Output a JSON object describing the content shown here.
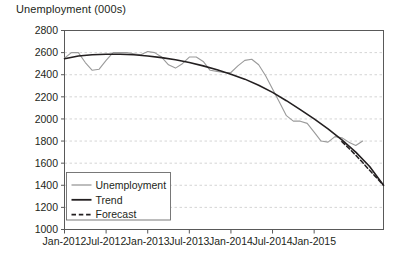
{
  "chart_data": {
    "type": "line",
    "title": "Unemployment (000s)",
    "xlabel": "",
    "ylabel": "",
    "ylim": [
      1000,
      2800
    ],
    "yticks": [
      1000,
      1200,
      1400,
      1600,
      1800,
      2000,
      2200,
      2400,
      2600,
      2800
    ],
    "ytick_labels": [
      "1000",
      "1200",
      "1400",
      "1600",
      "1800",
      "2000",
      "2200",
      "2400",
      "2600",
      "2800"
    ],
    "xlim": [
      0,
      46
    ],
    "xticks": [
      0,
      6,
      12,
      18,
      24,
      30,
      36
    ],
    "xtick_labels": [
      "Jan-2012",
      "Jul-2012",
      "Jan-2013",
      "Jul-2013",
      "Jan-2014",
      "Jul-2014",
      "Jan-2015"
    ],
    "grid": true,
    "grid_axis": "y",
    "legend_position": "lower-left",
    "series": [
      {
        "name": "Unemployment",
        "style": "solid",
        "color": "#9a9a9a",
        "width": 1.1,
        "x": [
          0,
          1,
          2,
          3,
          4,
          5,
          6,
          7,
          8,
          9,
          10,
          11,
          12,
          13,
          14,
          15,
          16,
          17,
          18,
          19,
          20,
          21,
          22,
          23,
          24,
          25,
          26,
          27,
          28,
          29,
          30,
          31,
          32,
          33,
          34,
          35,
          36,
          37,
          38,
          39,
          40,
          41,
          42,
          43
        ],
        "values": [
          2550,
          2600,
          2600,
          2510,
          2440,
          2450,
          2530,
          2600,
          2600,
          2600,
          2590,
          2580,
          2610,
          2600,
          2560,
          2490,
          2460,
          2500,
          2560,
          2560,
          2520,
          2440,
          2430,
          2420,
          2420,
          2480,
          2530,
          2540,
          2490,
          2390,
          2270,
          2150,
          2030,
          1980,
          1980,
          1960,
          1880,
          1800,
          1790,
          1840,
          1830,
          1790,
          1760,
          1800
        ]
      },
      {
        "name": "Trend",
        "style": "solid",
        "color": "#231f20",
        "width": 1.6,
        "x": [
          0,
          2,
          4,
          6,
          8,
          10,
          12,
          14,
          16,
          18,
          20,
          22,
          24,
          26,
          28,
          30,
          32,
          34,
          36,
          38,
          40,
          42,
          44,
          46
        ],
        "values": [
          2545,
          2570,
          2580,
          2585,
          2585,
          2580,
          2570,
          2555,
          2535,
          2510,
          2480,
          2445,
          2405,
          2360,
          2305,
          2240,
          2165,
          2085,
          2000,
          1910,
          1810,
          1700,
          1570,
          1400
        ]
      },
      {
        "name": "Forecast",
        "style": "dashed",
        "color": "#231f20",
        "width": 1.5,
        "x": [
          40,
          41,
          42,
          43,
          44,
          45,
          46
        ],
        "values": [
          1795,
          1735,
          1672,
          1605,
          1535,
          1468,
          1400
        ]
      }
    ],
    "legend": [
      {
        "label": "Unemployment",
        "style": "solid",
        "color": "#9a9a9a",
        "width": 1.3
      },
      {
        "label": "Trend",
        "style": "solid",
        "color": "#231f20",
        "width": 1.8
      },
      {
        "label": "Forecast",
        "style": "dashed",
        "color": "#231f20",
        "width": 1.6
      }
    ]
  },
  "colors": {
    "background": "#ffffff",
    "axis": "#595959",
    "grid": "#c9c9c9",
    "text": "#231f20",
    "series_unemployment": "#9a9a9a",
    "series_trend": "#231f20",
    "series_forecast": "#231f20"
  }
}
